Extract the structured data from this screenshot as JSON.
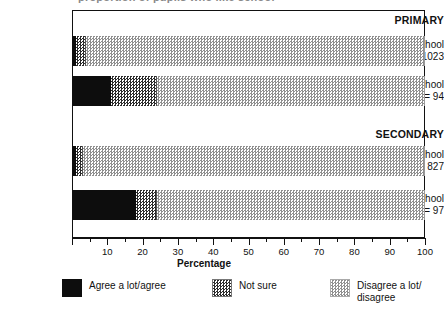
{
  "title_remnant": "proportion of pupils who like school",
  "chart_data": {
    "type": "bar",
    "orientation": "horizontal",
    "stacked": true,
    "title": "",
    "xlabel": "Percentage",
    "ylabel": "",
    "xlim": [
      0,
      100
    ],
    "grid": false,
    "legend_position": "bottom",
    "major_tick_step": 10,
    "minor_tick_step": 5,
    "xticks": [
      0,
      10,
      20,
      30,
      40,
      50,
      60,
      70,
      80,
      90,
      100
    ],
    "xticklabels": [
      "",
      "10",
      "20",
      "30",
      "40",
      "50",
      "60",
      "70",
      "80",
      "90",
      "100"
    ],
    "groups": [
      {
        "label": "PRIMARY",
        "rows": [
          {
            "label_line1": "Like school",
            "label_line2": "N = 1023",
            "n": 1023,
            "values": [
              1,
              3,
              96
            ]
          },
          {
            "label_line1": "Disike school",
            "label_line2": "N = 94",
            "n": 94,
            "values": [
              11,
              13,
              76
            ]
          }
        ]
      },
      {
        "label": "SECONDARY",
        "rows": [
          {
            "label_line1": "Like school",
            "label_line2": "N = 827",
            "n": 827,
            "values": [
              1,
              2,
              97
            ]
          },
          {
            "label_line1": "Disike school",
            "label_line2": "N = 97",
            "n": 97,
            "values": [
              18,
              6,
              76
            ]
          }
        ]
      }
    ],
    "series": [
      {
        "name": "Agree a lot/agree",
        "color": "#0d0d0d",
        "values": [
          1,
          11,
          1,
          18
        ]
      },
      {
        "name": "Not sure",
        "color": "#2b2b2b",
        "values": [
          3,
          13,
          2,
          6
        ]
      },
      {
        "name": "Disagree a lot/ disagree",
        "color": "#8f8f8f",
        "values": [
          96,
          76,
          97,
          76
        ]
      }
    ],
    "categories": [
      "PRIMARY Like school",
      "PRIMARY Disike school",
      "SECONDARY Like school",
      "SECONDARY Disike school"
    ]
  },
  "legend": {
    "items": [
      {
        "label": "Agree a lot/agree",
        "label_line2": "",
        "swatch": "agree"
      },
      {
        "label": "Not sure",
        "label_line2": "",
        "swatch": "notsure"
      },
      {
        "label": "Disagree a lot/",
        "label_line2": "disagree",
        "swatch": "disagree"
      }
    ]
  }
}
